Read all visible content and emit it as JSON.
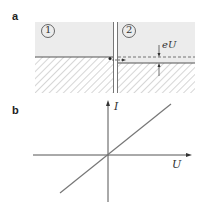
{
  "panel_a": {
    "label": "a",
    "region_1": "1",
    "region_2": "2",
    "annotation": "eU"
  },
  "panel_b": {
    "label": "b",
    "y_axis": "I",
    "x_axis": "U"
  },
  "colors": {
    "region_fill": "#ececec",
    "line": "#555555"
  }
}
